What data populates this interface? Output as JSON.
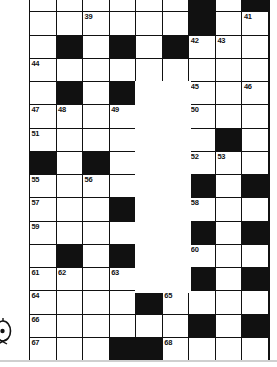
{
  "puzzle": {
    "title": "Crossword Grid",
    "columns": 9,
    "rows": 14,
    "colors": {
      "block": "#111111",
      "cell": "#ffffff",
      "rule": "#cfcfcf"
    },
    "legend": {
      "white_cell": "fillable-square",
      "black_cell": "block-square",
      "void_region": "blank-unused-region"
    },
    "corner_mark": "partial-publisher-logo",
    "cells": [
      [
        {
          "t": "w",
          "n": "36"
        },
        {
          "t": "w",
          "n": ""
        },
        {
          "t": "w",
          "n": "37"
        },
        {
          "t": "w",
          "n": ""
        },
        {
          "t": "w",
          "n": "38"
        },
        {
          "t": "w",
          "n": ""
        },
        {
          "t": "b",
          "n": ""
        },
        {
          "t": "w",
          "n": "40"
        },
        {
          "t": "b",
          "n": ""
        }
      ],
      [
        {
          "t": "w",
          "n": ""
        },
        {
          "t": "w",
          "n": ""
        },
        {
          "t": "w",
          "n": "39"
        },
        {
          "t": "w",
          "n": ""
        },
        {
          "t": "w",
          "n": ""
        },
        {
          "t": "w",
          "n": ""
        },
        {
          "t": "b",
          "n": ""
        },
        {
          "t": "w",
          "n": ""
        },
        {
          "t": "w",
          "n": "41"
        }
      ],
      [
        {
          "t": "w",
          "n": ""
        },
        {
          "t": "b",
          "n": ""
        },
        {
          "t": "w",
          "n": ""
        },
        {
          "t": "b",
          "n": ""
        },
        {
          "t": "w",
          "n": ""
        },
        {
          "t": "b",
          "n": ""
        },
        {
          "t": "w",
          "n": "42"
        },
        {
          "t": "w",
          "n": "43"
        },
        {
          "t": "w",
          "n": ""
        }
      ],
      [
        {
          "t": "w",
          "n": "44"
        },
        {
          "t": "w",
          "n": ""
        },
        {
          "t": "w",
          "n": ""
        },
        {
          "t": "w",
          "n": ""
        },
        {
          "t": "w",
          "n": ""
        },
        {
          "t": "w",
          "n": ""
        },
        {
          "t": "w",
          "n": ""
        },
        {
          "t": "w",
          "n": ""
        },
        {
          "t": "w",
          "n": ""
        }
      ],
      [
        {
          "t": "w",
          "n": ""
        },
        {
          "t": "b",
          "n": ""
        },
        {
          "t": "w",
          "n": ""
        },
        {
          "t": "b",
          "n": ""
        },
        {
          "t": "v",
          "n": ""
        },
        {
          "t": "v",
          "n": ""
        },
        {
          "t": "w",
          "n": "45"
        },
        {
          "t": "w",
          "n": ""
        },
        {
          "t": "w",
          "n": "46"
        }
      ],
      [
        {
          "t": "w",
          "n": "47"
        },
        {
          "t": "w",
          "n": "48"
        },
        {
          "t": "w",
          "n": ""
        },
        {
          "t": "w",
          "n": "49"
        },
        {
          "t": "v",
          "n": ""
        },
        {
          "t": "v",
          "n": ""
        },
        {
          "t": "w",
          "n": "50"
        },
        {
          "t": "w",
          "n": ""
        },
        {
          "t": "w",
          "n": ""
        }
      ],
      [
        {
          "t": "w",
          "n": "51"
        },
        {
          "t": "w",
          "n": ""
        },
        {
          "t": "w",
          "n": ""
        },
        {
          "t": "w",
          "n": ""
        },
        {
          "t": "v",
          "n": ""
        },
        {
          "t": "v",
          "n": ""
        },
        {
          "t": "w",
          "n": ""
        },
        {
          "t": "b",
          "n": ""
        },
        {
          "t": "w",
          "n": ""
        }
      ],
      [
        {
          "t": "b",
          "n": ""
        },
        {
          "t": "w",
          "n": ""
        },
        {
          "t": "b",
          "n": ""
        },
        {
          "t": "w",
          "n": ""
        },
        {
          "t": "v",
          "n": ""
        },
        {
          "t": "v",
          "n": ""
        },
        {
          "t": "w",
          "n": "52"
        },
        {
          "t": "w",
          "n": "53"
        },
        {
          "t": "w",
          "n": ""
        }
      ],
      [
        {
          "t": "w",
          "n": "55"
        },
        {
          "t": "w",
          "n": ""
        },
        {
          "t": "w",
          "n": "56"
        },
        {
          "t": "w",
          "n": ""
        },
        {
          "t": "v",
          "n": ""
        },
        {
          "t": "v",
          "n": ""
        },
        {
          "t": "b",
          "n": ""
        },
        {
          "t": "w",
          "n": ""
        },
        {
          "t": "b",
          "n": ""
        }
      ],
      [
        {
          "t": "w",
          "n": "57"
        },
        {
          "t": "w",
          "n": ""
        },
        {
          "t": "w",
          "n": ""
        },
        {
          "t": "b",
          "n": ""
        },
        {
          "t": "v",
          "n": ""
        },
        {
          "t": "v",
          "n": ""
        },
        {
          "t": "w",
          "n": "58"
        },
        {
          "t": "w",
          "n": ""
        },
        {
          "t": "w",
          "n": ""
        }
      ],
      [
        {
          "t": "w",
          "n": "59"
        },
        {
          "t": "w",
          "n": ""
        },
        {
          "t": "w",
          "n": ""
        },
        {
          "t": "w",
          "n": ""
        },
        {
          "t": "v",
          "n": ""
        },
        {
          "t": "v",
          "n": ""
        },
        {
          "t": "b",
          "n": ""
        },
        {
          "t": "w",
          "n": ""
        },
        {
          "t": "b",
          "n": ""
        }
      ],
      [
        {
          "t": "w",
          "n": ""
        },
        {
          "t": "b",
          "n": ""
        },
        {
          "t": "w",
          "n": ""
        },
        {
          "t": "b",
          "n": ""
        },
        {
          "t": "v",
          "n": ""
        },
        {
          "t": "v",
          "n": ""
        },
        {
          "t": "w",
          "n": "60"
        },
        {
          "t": "w",
          "n": ""
        },
        {
          "t": "w",
          "n": ""
        }
      ],
      [
        {
          "t": "w",
          "n": "61"
        },
        {
          "t": "w",
          "n": "62"
        },
        {
          "t": "w",
          "n": ""
        },
        {
          "t": "w",
          "n": "63"
        },
        {
          "t": "v",
          "n": ""
        },
        {
          "t": "v",
          "n": ""
        },
        {
          "t": "b",
          "n": ""
        },
        {
          "t": "w",
          "n": ""
        },
        {
          "t": "b",
          "n": ""
        }
      ],
      [
        {
          "t": "w",
          "n": "64"
        },
        {
          "t": "w",
          "n": ""
        },
        {
          "t": "w",
          "n": ""
        },
        {
          "t": "w",
          "n": ""
        },
        {
          "t": "b",
          "n": ""
        },
        {
          "t": "w",
          "n": "65"
        },
        {
          "t": "w",
          "n": ""
        },
        {
          "t": "w",
          "n": ""
        },
        {
          "t": "w",
          "n": ""
        }
      ],
      [
        {
          "t": "w",
          "n": "66"
        },
        {
          "t": "w",
          "n": ""
        },
        {
          "t": "w",
          "n": ""
        },
        {
          "t": "w",
          "n": ""
        },
        {
          "t": "w",
          "n": ""
        },
        {
          "t": "w",
          "n": ""
        },
        {
          "t": "b",
          "n": ""
        },
        {
          "t": "w",
          "n": ""
        },
        {
          "t": "b",
          "n": ""
        }
      ],
      [
        {
          "t": "w",
          "n": "67"
        },
        {
          "t": "w",
          "n": ""
        },
        {
          "t": "w",
          "n": ""
        },
        {
          "t": "b",
          "n": ""
        },
        {
          "t": "b",
          "n": ""
        },
        {
          "t": "w",
          "n": "68"
        },
        {
          "t": "w",
          "n": ""
        },
        {
          "t": "w",
          "n": ""
        },
        {
          "t": "w",
          "n": ""
        }
      ]
    ]
  }
}
